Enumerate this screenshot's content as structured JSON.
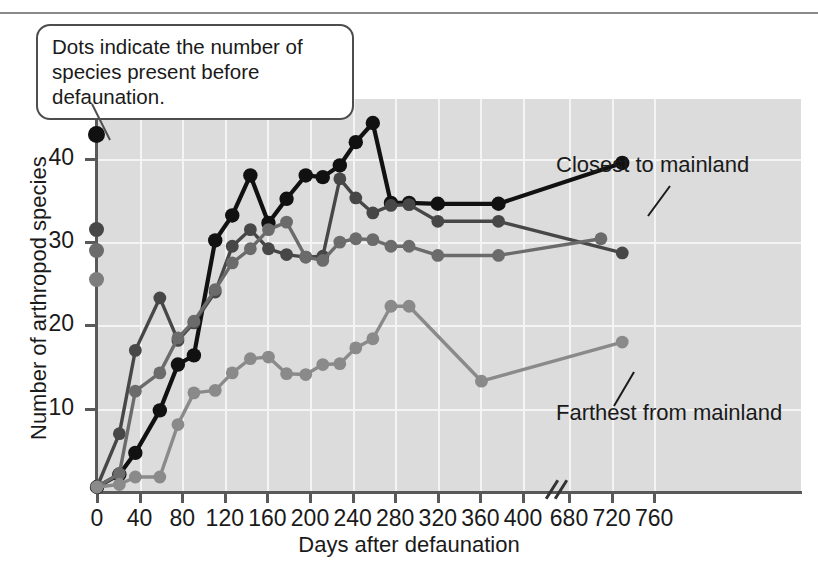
{
  "callout": {
    "line1": "Dots indicate the number of",
    "line2": "species present before defaunation."
  },
  "annotations": {
    "closest": "Closest to mainland",
    "farthest": "Farthest from mainland"
  },
  "chart_data": {
    "type": "line",
    "title": "",
    "xlabel": "Days after defaunation",
    "ylabel": "Number of arthropod species",
    "xlim": [
      0,
      760
    ],
    "ylim": [
      0,
      46
    ],
    "grid": true,
    "axis_break": {
      "after": 400,
      "before": 680,
      "label": "//"
    },
    "xticks": [
      0,
      40,
      80,
      120,
      160,
      200,
      240,
      280,
      320,
      360,
      400,
      680,
      720,
      760
    ],
    "yticks": [
      10,
      20,
      30,
      40
    ],
    "legend_position": "inline-annotation",
    "pre_defaunation": [
      {
        "series": "Closest to mainland",
        "value": 43,
        "color": "#111111"
      },
      {
        "series": "Island 2",
        "value": 31.5,
        "color": "#474747"
      },
      {
        "series": "Island 3",
        "value": 29,
        "color": "#6b6b6b"
      },
      {
        "series": "Farthest from mainland",
        "value": 25.5,
        "color": "#7d7d7d"
      }
    ],
    "series": [
      {
        "name": "Closest to mainland",
        "color": "#111111",
        "x": [
          0,
          21,
          36,
          59,
          76,
          91,
          111,
          127,
          144,
          161,
          178,
          196,
          212,
          228,
          243,
          259,
          276,
          293,
          320,
          377,
          730
        ],
        "values": [
          0.6,
          2.1,
          4.7,
          9.8,
          15.3,
          16.4,
          30.2,
          33.2,
          38.0,
          32.3,
          35.2,
          38.0,
          37.8,
          39.2,
          42.0,
          44.3,
          34.7,
          34.7,
          34.6,
          34.6,
          39.5
        ]
      },
      {
        "name": "Island 2",
        "color": "#474747",
        "x": [
          0,
          21,
          36,
          59,
          76,
          91,
          111,
          127,
          144,
          161,
          178,
          196,
          212,
          228,
          243,
          259,
          276,
          293,
          320,
          377,
          730
        ],
        "values": [
          0.6,
          7.0,
          17.0,
          23.3,
          18.2,
          20.3,
          24.0,
          29.5,
          31.5,
          29.2,
          28.5,
          28.2,
          28.3,
          37.6,
          35.3,
          33.5,
          34.4,
          34.5,
          32.5,
          32.5,
          28.7
        ]
      },
      {
        "name": "Island 3",
        "color": "#6b6b6b",
        "x": [
          0,
          21,
          36,
          59,
          76,
          91,
          111,
          127,
          144,
          161,
          178,
          196,
          212,
          228,
          243,
          259,
          276,
          293,
          320,
          377,
          710
        ],
        "values": [
          0.6,
          2.2,
          12.1,
          14.3,
          18.5,
          20.5,
          24.3,
          27.5,
          29.2,
          31.5,
          32.4,
          28.2,
          27.8,
          30.0,
          30.4,
          30.3,
          29.5,
          29.5,
          28.4,
          28.4,
          30.4
        ]
      },
      {
        "name": "Farthest from mainland",
        "color": "#8a8a8a",
        "x": [
          0,
          21,
          36,
          59,
          76,
          91,
          111,
          127,
          144,
          161,
          178,
          196,
          212,
          228,
          243,
          259,
          276,
          293,
          361,
          730
        ],
        "values": [
          0.6,
          0.9,
          1.8,
          1.8,
          8.1,
          11.9,
          12.2,
          14.3,
          16.0,
          16.2,
          14.2,
          14.1,
          15.3,
          15.4,
          17.3,
          18.4,
          22.3,
          22.3,
          13.3,
          18.0
        ]
      }
    ]
  }
}
